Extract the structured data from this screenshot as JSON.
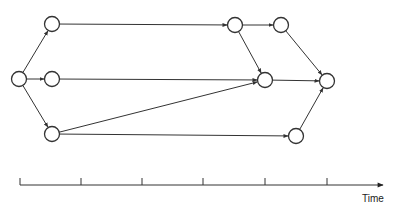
{
  "diagram": {
    "type": "network-flow",
    "nodes": [
      {
        "id": "start",
        "x": 19,
        "y": 79
      },
      {
        "id": "top-1",
        "x": 52,
        "y": 24
      },
      {
        "id": "mid-1",
        "x": 52,
        "y": 79
      },
      {
        "id": "bot-1",
        "x": 52,
        "y": 134
      },
      {
        "id": "top-2",
        "x": 235,
        "y": 25
      },
      {
        "id": "top-3",
        "x": 281,
        "y": 25
      },
      {
        "id": "mid-2",
        "x": 265,
        "y": 80
      },
      {
        "id": "end",
        "x": 327,
        "y": 81
      },
      {
        "id": "bot-2",
        "x": 296,
        "y": 136
      }
    ],
    "edges": [
      {
        "from": "start",
        "to": "top-1"
      },
      {
        "from": "start",
        "to": "mid-1"
      },
      {
        "from": "start",
        "to": "bot-1"
      },
      {
        "from": "top-1",
        "to": "top-2"
      },
      {
        "from": "mid-1",
        "to": "mid-2"
      },
      {
        "from": "bot-1",
        "to": "mid-2"
      },
      {
        "from": "bot-1",
        "to": "bot-2"
      },
      {
        "from": "top-2",
        "to": "top-3"
      },
      {
        "from": "top-2",
        "to": "mid-2"
      },
      {
        "from": "top-3",
        "to": "end"
      },
      {
        "from": "mid-2",
        "to": "end"
      },
      {
        "from": "bot-2",
        "to": "end"
      }
    ],
    "node_radius": 7.5,
    "stroke_color": "#333333"
  },
  "timeline": {
    "axis_label": "Time",
    "x_start": 20,
    "x_end": 383,
    "y": 185,
    "ticks": [
      20,
      81,
      142,
      203,
      265,
      327
    ]
  }
}
